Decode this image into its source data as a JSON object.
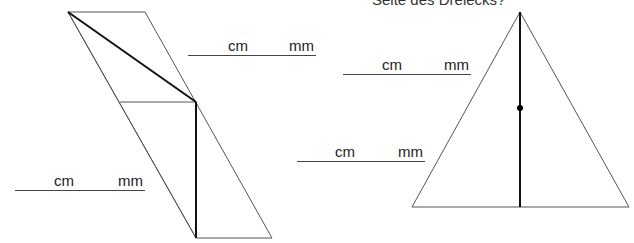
{
  "header": {
    "question_fragment": "Seite des Dreiecks?"
  },
  "answers": [
    {
      "id": "parallelogram-diagonal",
      "unit1": "cm",
      "unit2": "mm"
    },
    {
      "id": "parallelogram-height",
      "unit1": "cm",
      "unit2": "mm"
    },
    {
      "id": "triangle-upper-median",
      "unit1": "cm",
      "unit2": "mm"
    },
    {
      "id": "triangle-lower-median",
      "unit1": "cm",
      "unit2": "mm"
    }
  ],
  "figures": {
    "parallelogram": {
      "stroke": "#555555",
      "measured_stroke": "#111111"
    },
    "triangle": {
      "stroke": "#555555",
      "median_stroke": "#111111",
      "midpoint_color": "#000000"
    }
  }
}
